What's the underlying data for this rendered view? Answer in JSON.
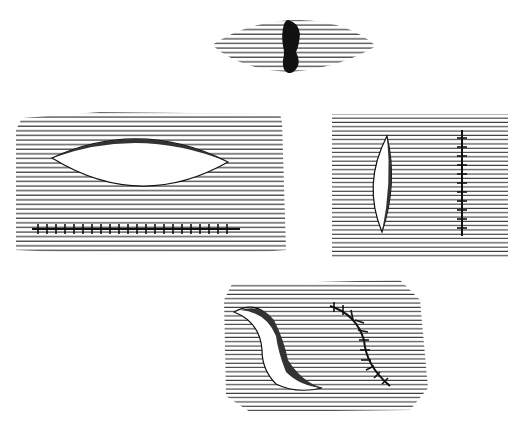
{
  "figure": {
    "background": "#ffffff",
    "ink": "#111111",
    "panels": [
      {
        "id": "lesion",
        "description": "dark lesion on hatched skin"
      },
      {
        "id": "elliptical-excision-horizontal",
        "description": "horizontal elliptical excision with sutured closure below"
      },
      {
        "id": "elliptical-excision-vertical",
        "description": "vertical elliptical excision with sutured closure to the right"
      },
      {
        "id": "s-shaped-excision",
        "description": "S-shaped excision with curved sutured closure"
      }
    ]
  }
}
